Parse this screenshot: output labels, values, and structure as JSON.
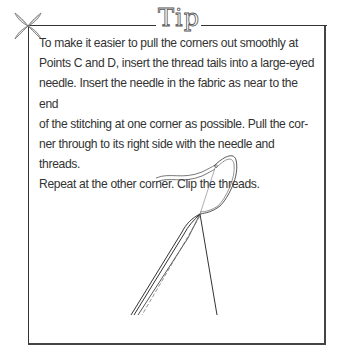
{
  "tip": {
    "title": "Tip",
    "body": "To make it easier to pull the corners out smoothly at Points C and D, insert the thread tails into a large-eyed needle. Insert the needle in the fabric as near to the end of the stitching at one corner as possible. Pull the corner through to its right side with the needle and threads. Repeat at the other corner. Clip the threads.",
    "lines": [
      "To make it easier to pull the corners out smoothly at",
      "Points C and D, insert the thread tails into a large-eyed",
      "needle. Insert the needle in the fabric as near to the end",
      "of the stitching at one corner as possible. Pull the cor-",
      "ner through to its right side with the needle and threads.",
      "Repeat at the other corner. Clip the threads."
    ],
    "illustration": "needle-with-thread-icon",
    "ornament": "flower-ornament-icon"
  },
  "colors": {
    "border": "#333333",
    "text": "#333333",
    "background": "#ffffff"
  }
}
